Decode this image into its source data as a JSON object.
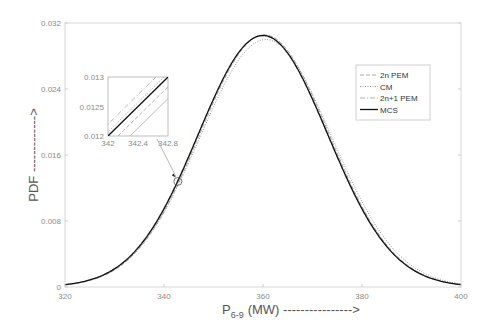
{
  "chart_data": {
    "type": "line",
    "title": "",
    "xlabel": "P_6-9 (MW) --------------->",
    "xlabel_main": "P",
    "xlabel_sub": "6-9",
    "xlabel_rest": "(MW) ---------------->",
    "ylabel": "PDF ------------->",
    "xlim": [
      320,
      400
    ],
    "ylim": [
      0,
      0.032
    ],
    "x_ticks": [
      "320",
      "340",
      "360",
      "380",
      "400"
    ],
    "y_ticks": [
      "0",
      "0.008",
      "0.016",
      "0.024",
      "0.032"
    ],
    "grid": false,
    "legend_position": "upper right",
    "series": [
      {
        "name": "2n PEM",
        "style": "dashed",
        "color": "#a8a8a8",
        "mean": 360.3,
        "std": 13.05
      },
      {
        "name": "CM",
        "style": "dotted",
        "color": "#9a9a9a",
        "mean": 360.6,
        "std": 13.3
      },
      {
        "name": "2n+1 PEM",
        "style": "dashdot",
        "color": "#b0b0b0",
        "mean": 359.9,
        "std": 13.1
      },
      {
        "name": "MCS",
        "style": "solid",
        "color": "#111111",
        "mean": 360.0,
        "std": 13.08
      }
    ],
    "peak": {
      "x": 360,
      "y": 0.0305
    },
    "inset": {
      "xlim": [
        342,
        342.8
      ],
      "ylim": [
        0.012,
        0.013
      ],
      "x_ticks": [
        "342",
        "342.4",
        "342.8"
      ],
      "y_ticks": [
        "0.012",
        "0.0125",
        "0.013"
      ],
      "zoom_point": {
        "x": 342.8,
        "y": 0.0128
      }
    }
  }
}
